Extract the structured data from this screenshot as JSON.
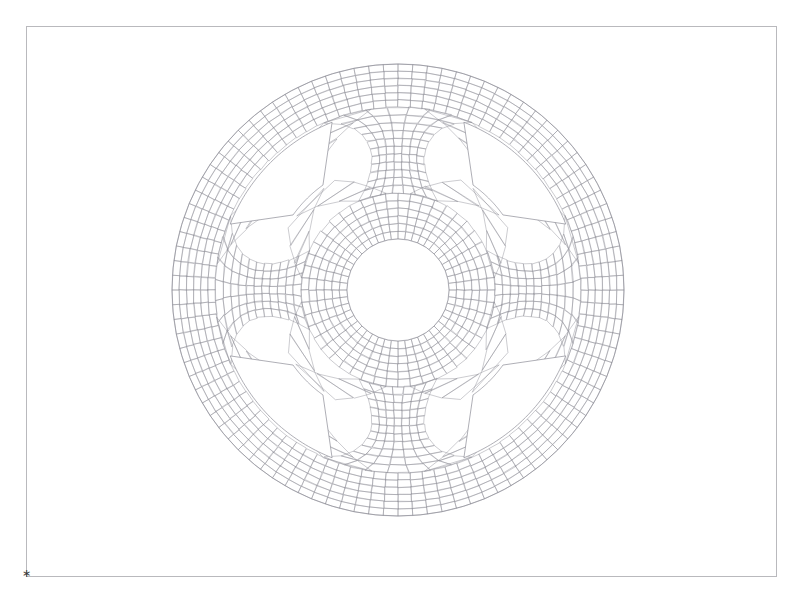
{
  "page": {
    "title": "Finite Element Mesh — Wheel / Flywheel Cross Section",
    "background_color": "#ffffff",
    "width": 802,
    "height": 597
  },
  "frame": {
    "name": "plot-border",
    "x": 26,
    "y": 26,
    "width": 751,
    "height": 551,
    "stroke_color": "#b9b9bd",
    "stroke_width": 1
  },
  "corner_marker": {
    "glyph": "∗",
    "x": 24,
    "y": 574,
    "color": "#3a3a3a"
  },
  "mesh": {
    "element_type": "quad",
    "line_color": "#8d8d96",
    "line_width": 0.45,
    "fill_color": "#ffffff",
    "center_x": 398,
    "center_y": 290,
    "outer_radius": 226,
    "rim_inner_radius": 183,
    "hub_outer_radius": 97,
    "hub_inner_radius": 51,
    "spoke_count": 4,
    "spoke_angles_deg": [
      90,
      180,
      270,
      0
    ],
    "spoke_half_width_deg": 11,
    "rim_radial_divisions": 6,
    "hub_radial_divisions": 6,
    "spoke_radial_divisions": 11,
    "circumferential_divisions": 96,
    "void_count": 4,
    "void_corner_radius": 18
  },
  "chart_data": {
    "type": "scatter",
    "title": "Finite Element Mesh — Wheel / Flywheel Cross Section",
    "xlabel": "",
    "ylabel": "",
    "legend": [],
    "grid": false,
    "annotations": [
      "∗"
    ],
    "xlim": [
      26,
      777
    ],
    "ylim": [
      26,
      577
    ],
    "geometry": {
      "outer_circle": {
        "cx": 398,
        "cy": 290,
        "r": 226
      },
      "rim_inner_circle": {
        "cx": 398,
        "cy": 290,
        "r": 183
      },
      "hub_outer_circle": {
        "cx": 398,
        "cy": 290,
        "r": 97
      },
      "hub_bore_circle": {
        "cx": 398,
        "cy": 290,
        "r": 51
      },
      "spokes": [
        {
          "angle_deg": 90,
          "half_width_deg": 11
        },
        {
          "angle_deg": 180,
          "half_width_deg": 11
        },
        {
          "angle_deg": 270,
          "half_width_deg": 11
        },
        {
          "angle_deg": 0,
          "half_width_deg": 11
        }
      ]
    }
  }
}
